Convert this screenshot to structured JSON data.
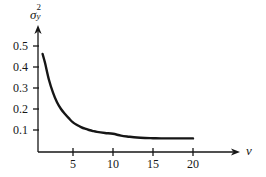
{
  "chart_data": {
    "type": "line",
    "title": "",
    "subtitle": "",
    "xlabel": "v",
    "ylabel": "σ²y",
    "ylabel_parts": {
      "base": "σ",
      "superscript": "2",
      "subscript": "y"
    },
    "xlim": [
      0,
      22
    ],
    "ylim": [
      0,
      0.55
    ],
    "grid": false,
    "legend": null,
    "x_ticks": [
      5,
      10,
      15,
      20
    ],
    "x_tick_labels": [
      "5",
      "10",
      "15",
      "20"
    ],
    "y_ticks": [
      0.1,
      0.2,
      0.3,
      0.4,
      0.5
    ],
    "y_tick_labels": [
      "0.1",
      "0.2",
      "0.3",
      "0.4",
      "0.5"
    ],
    "axis_style": "arrowed-l-shape",
    "series": [
      {
        "name": "variance-decay",
        "color": "#161616",
        "line_width": 2.4,
        "x": [
          1.2,
          1.5,
          2,
          2.5,
          3,
          3.5,
          4,
          4.5,
          5,
          5.5,
          6,
          6.5,
          7,
          7.5,
          8,
          9,
          10,
          11,
          12,
          13,
          14,
          15,
          16,
          17,
          18,
          19,
          20
        ],
        "y": [
          0.462,
          0.42,
          0.338,
          0.278,
          0.232,
          0.2,
          0.176,
          0.155,
          0.136,
          0.124,
          0.114,
          0.106,
          0.1,
          0.095,
          0.091,
          0.086,
          0.082,
          0.073,
          0.068,
          0.064,
          0.062,
          0.061,
          0.06,
          0.06,
          0.06,
          0.06,
          0.06
        ]
      }
    ]
  },
  "axis_labels": {
    "y": [
      "0.5",
      "0.4",
      "0.3",
      "0.2",
      "0.1"
    ],
    "x": [
      "5",
      "10",
      "15",
      "20"
    ],
    "x_title": "v"
  },
  "sigma": {
    "base": "σ",
    "sup": "2",
    "sub": "y"
  }
}
